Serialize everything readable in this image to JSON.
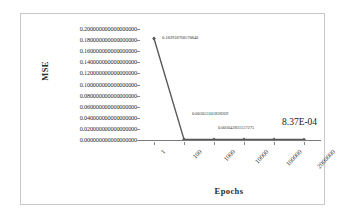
{
  "chart_data": {
    "type": "line",
    "title": "",
    "xlabel": "Epochs",
    "ylabel": "MSE",
    "categories": [
      "1",
      "100",
      "1000",
      "10000",
      "100000",
      "2000000"
    ],
    "values": [
      0.18291876857084,
      0.001053101828369,
      0.001042831157275,
      0.0009,
      0.00086,
      0.000837
    ],
    "ylim": [
      0.0,
      0.2
    ],
    "ytick_labels": [
      "0.200000000000000000",
      "0.180000000000000000",
      "0.160000000000000000",
      "0.140000000000000000",
      "0.120000000000000000",
      "0.100000000000000000",
      "0.080000000000000000",
      "0.060000000000000000",
      "0.040000000000000000",
      "0.020000000000000000",
      "0.000000000000000000"
    ],
    "ytick_values": [
      0.2,
      0.18,
      0.16,
      0.14,
      0.12,
      0.1,
      0.08,
      0.06,
      0.04,
      0.02,
      0.0
    ],
    "grid": false,
    "legend": "none",
    "series_color": "#595959",
    "marker": "diamond",
    "point_labels": [
      "0.182918768570840",
      "0.001053101828369",
      "0.001042831157275",
      "",
      "",
      "8.37E-04"
    ]
  }
}
